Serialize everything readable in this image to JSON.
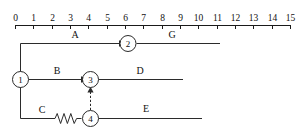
{
  "chart_data": {
    "type": "diagram",
    "title": "",
    "subtype": "activity-on-arrow network diagram with time scale",
    "axis": {
      "orientation": "horizontal",
      "label": "",
      "min": 0,
      "max": 15,
      "tick_step": 1,
      "tick_labels": [
        "0",
        "1",
        "2",
        "3",
        "4",
        "5",
        "6",
        "7",
        "8",
        "9",
        "10",
        "11",
        "12",
        "13",
        "14",
        "15"
      ],
      "tick_values": [
        0,
        1,
        2,
        3,
        4,
        5,
        6,
        7,
        8,
        9,
        10,
        11,
        12,
        13,
        14,
        15
      ],
      "grid": false,
      "pixel_start_x": 15,
      "pixel_end_x": 290,
      "pixel_y": 25
    },
    "nodes": [
      {
        "id": "n1",
        "label": "1",
        "x": 0,
        "y": 79,
        "time": 0
      },
      {
        "id": "n2",
        "label": "2",
        "x": 6,
        "y": 43,
        "time": 6
      },
      {
        "id": "n3",
        "label": "3",
        "x": 4,
        "y": 79,
        "time": 4
      },
      {
        "id": "n4",
        "label": "4",
        "x": 4,
        "y": 117,
        "time": 4
      }
    ],
    "activities": [
      {
        "label": "A",
        "from": "1",
        "to": "2",
        "start_time": 0,
        "end_time": 6,
        "row": "top",
        "style": "solid-arrow",
        "label_x": 75,
        "label_y": 38
      },
      {
        "label": "G",
        "from": "2",
        "to": "",
        "start_time": 6,
        "end_time": 11,
        "row": "top",
        "style": "solid-open",
        "label_x": 172,
        "label_y": 38
      },
      {
        "label": "B",
        "from": "1",
        "to": "3",
        "start_time": 0,
        "end_time": 4,
        "row": "middle",
        "style": "solid-arrow",
        "label_x": 57,
        "label_y": 74
      },
      {
        "label": "D",
        "from": "3",
        "to": "",
        "start_time": 4,
        "end_time": 9,
        "row": "middle",
        "style": "solid-open",
        "label_x": 140,
        "label_y": 74
      },
      {
        "label": "C",
        "from": "1",
        "to": "4",
        "start_time": 0,
        "end_time": 4,
        "row": "bottom",
        "style": "spring-delay",
        "label_x": 42,
        "label_y": 113
      },
      {
        "label": "E",
        "from": "4",
        "to": "",
        "start_time": 4,
        "end_time": 10,
        "row": "bottom",
        "style": "solid-open",
        "label_x": 146,
        "label_y": 112
      }
    ],
    "dummy_activities": [
      {
        "label": "",
        "from": "4",
        "to": "3",
        "style": "dashed-arrow",
        "direction": "upward"
      }
    ],
    "colors": {
      "line": "#2b2b2b",
      "axis": "#1a1a1a",
      "text": "#111111",
      "background": "#ffffff",
      "node_fill": "#ffffff"
    }
  }
}
